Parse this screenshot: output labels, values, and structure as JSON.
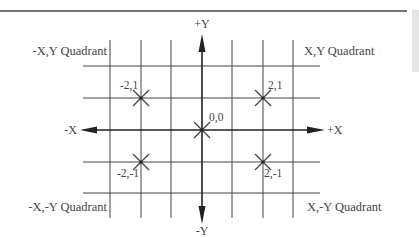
{
  "diagram": {
    "axes": {
      "positive_x_label": "+X",
      "negative_x_label": "-X",
      "positive_y_label": "+Y",
      "negative_y_label": "-Y"
    },
    "quadrants": {
      "top_left": "-X,Y Quadrant",
      "top_right": "X,Y Quadrant",
      "bottom_left": "-X,-Y Quadrant",
      "bottom_right": "X,-Y Quadrant"
    },
    "points": [
      {
        "label": "-2,1",
        "x": -2,
        "y": 1
      },
      {
        "label": "2,1",
        "x": 2,
        "y": 1
      },
      {
        "label": "0,0",
        "x": 0,
        "y": 0
      },
      {
        "label": "-2,-1",
        "x": -2,
        "y": -1
      },
      {
        "label": "2,-1",
        "x": 2,
        "y": -1
      }
    ],
    "grid": {
      "columns_x": [
        -3,
        -2,
        -1,
        0,
        1,
        2,
        3
      ],
      "rows_y": [
        2,
        1,
        0,
        -1,
        -2
      ]
    },
    "colors": {
      "line": "#333333",
      "text": "#444444",
      "sidebar": "#e4e4e4"
    }
  }
}
